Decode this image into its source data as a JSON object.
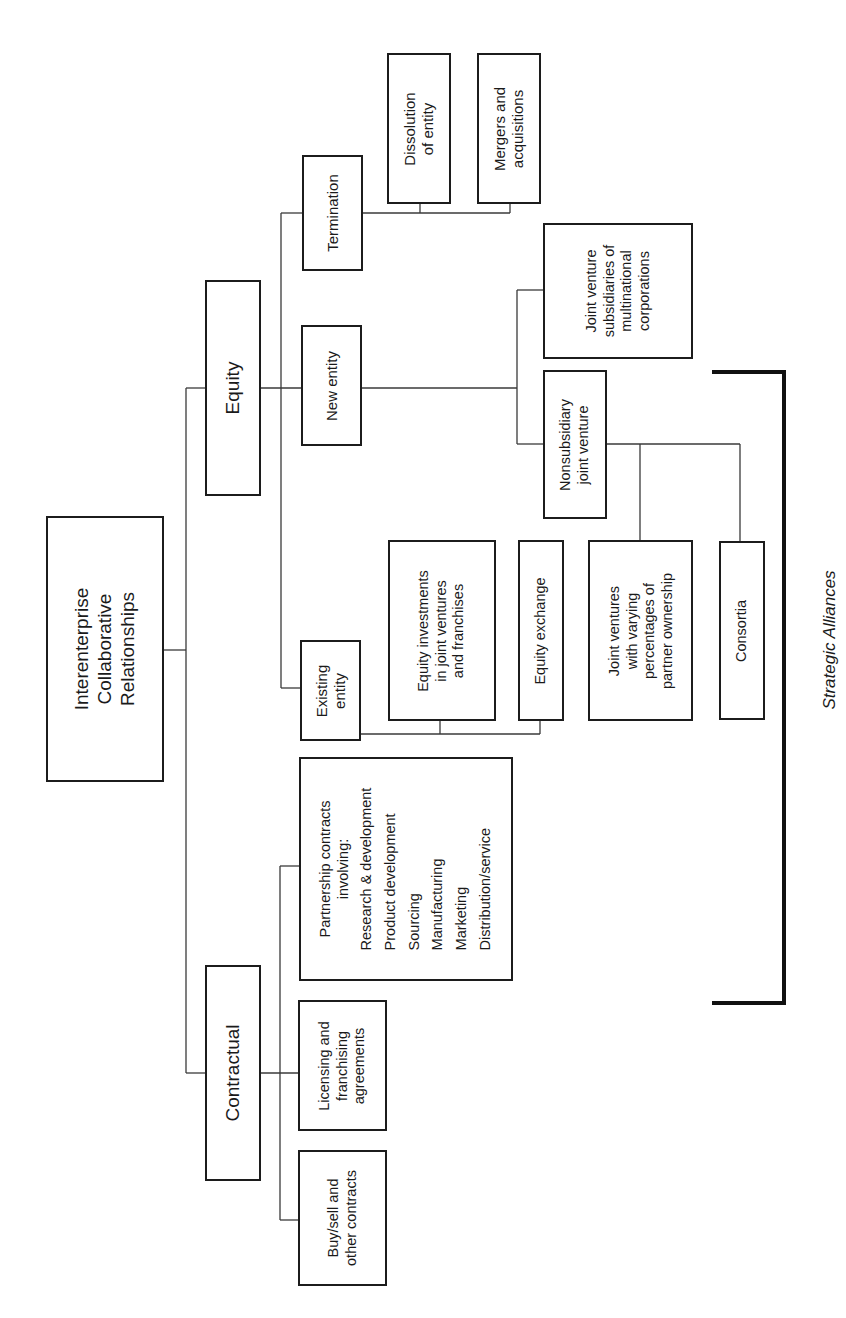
{
  "diagram": {
    "title": "Interenterprise Collaborative Relationships",
    "orientation": "rotated 90 degrees counterclockwise",
    "root": {
      "lines": [
        "Interenterprise",
        "Collaborative",
        "Relationships"
      ]
    },
    "branches": {
      "equity": {
        "label": "Equity",
        "children": {
          "termination": {
            "label": "Termination",
            "children": {
              "dissolution": {
                "lines": [
                  "Dissolution",
                  "of entity"
                ]
              },
              "mergers": {
                "lines": [
                  "Mergers and",
                  "acquisitions"
                ]
              }
            }
          },
          "new_entity": {
            "label": "New entity",
            "children": {
              "jv_subsidiaries": {
                "lines": [
                  "Joint venture",
                  "subsidiaries of",
                  "multinational",
                  "corporations"
                ]
              },
              "nonsubsidiary": {
                "lines": [
                  "Nonsubsidiary",
                  "joint venture"
                ],
                "children": {
                  "jv_varying": {
                    "lines": [
                      "Joint ventures",
                      "with varying",
                      "percentages of",
                      "partner ownership"
                    ]
                  },
                  "consortia": {
                    "label": "Consortia"
                  }
                }
              }
            }
          },
          "existing_entity": {
            "lines": [
              "Existing",
              "entity"
            ],
            "children": {
              "equity_investments": {
                "lines": [
                  "Equity investments",
                  "in joint ventures",
                  "and franchises"
                ]
              },
              "equity_exchange": {
                "label": "Equity exchange"
              }
            }
          }
        }
      },
      "contractual": {
        "label": "Contractual",
        "children": {
          "partnership": {
            "heading": [
              "Partnership contracts",
              "involving:"
            ],
            "items": [
              "Research & development",
              "Product development",
              "Sourcing",
              "Manufacturing",
              "Marketing",
              "Distribution/service"
            ]
          },
          "licensing": {
            "lines": [
              "Licensing and",
              "franchising",
              "agreements"
            ]
          },
          "buysell": {
            "lines": [
              "Buy/sell and",
              "other contracts"
            ]
          }
        }
      }
    },
    "bracket": {
      "label": "Strategic Alliances"
    }
  }
}
